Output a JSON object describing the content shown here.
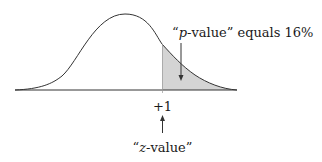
{
  "diagram": {
    "type": "normal-distribution-tail",
    "labels": {
      "p_value": {
        "quote_open": "“",
        "italic": "p",
        "rest": "-value” equals 16%"
      },
      "z_tick": "+1",
      "z_value": {
        "quote_open": "“",
        "italic": "z",
        "rest": "-value”"
      }
    },
    "shaded_region": {
      "from_z": 1,
      "to_z": "infinity",
      "area_percent": 16
    },
    "colors": {
      "line": "#333333",
      "shade": "#d4d4d4",
      "text": "#1a1a1a"
    }
  }
}
